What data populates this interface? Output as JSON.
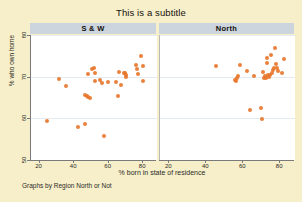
{
  "figure": {
    "subtitle": "This is a subtitle",
    "note": "Graphs by Region North or Not",
    "background_color": "#f7efc9",
    "panel_header_color": "#ccd4de",
    "marker_color": "#e8762c",
    "gridline_color": "#e3eaf2"
  },
  "chart_data": {
    "type": "scatter",
    "title": "This is a subtitle",
    "xlabel": "% born in state of residence",
    "ylabel": "% who own home",
    "note": "Graphs by Region North or Not",
    "xlim": [
      15,
      88
    ],
    "ylim": [
      50,
      80
    ],
    "xticks": [
      20,
      40,
      60,
      80
    ],
    "yticks": [
      50,
      60,
      70,
      80
    ],
    "grid": "horizontal",
    "legend": "none",
    "marker_color": "#e8762c",
    "panels": [
      {
        "label": "S & W",
        "points": [
          [
            24.3,
            59.3
          ],
          [
            31.2,
            69.5
          ],
          [
            35.1,
            67.8
          ],
          [
            42.3,
            57.9
          ],
          [
            46.2,
            58.6
          ],
          [
            46.0,
            65.6
          ],
          [
            47.3,
            65.4
          ],
          [
            48.1,
            65.1
          ],
          [
            49.4,
            65.0
          ],
          [
            47.9,
            70.7
          ],
          [
            50.6,
            71.9
          ],
          [
            51.3,
            72.2
          ],
          [
            52.2,
            70.8
          ],
          [
            52.0,
            68.9
          ],
          [
            55.0,
            69.2
          ],
          [
            56.4,
            68.4
          ],
          [
            57.3,
            55.8
          ],
          [
            59.6,
            68.8
          ],
          [
            64.3,
            68.7
          ],
          [
            65.4,
            65.3
          ],
          [
            65.8,
            71.2
          ],
          [
            66.9,
            67.9
          ],
          [
            68.9,
            71.0
          ],
          [
            69.6,
            70.9
          ],
          [
            69.9,
            70.3
          ],
          [
            70.2,
            69.9
          ],
          [
            75.8,
            72.8
          ],
          [
            76.3,
            71.9
          ],
          [
            77.0,
            70.6
          ],
          [
            78.9,
            74.9
          ],
          [
            79.6,
            72.6
          ],
          [
            79.9,
            68.9
          ]
        ]
      },
      {
        "label": "North",
        "points": [
          [
            45.1,
            72.6
          ],
          [
            55.5,
            69.3
          ],
          [
            56.2,
            68.9
          ],
          [
            56.4,
            69.8
          ],
          [
            57.0,
            70.2
          ],
          [
            58.2,
            72.9
          ],
          [
            62.3,
            71.4
          ],
          [
            63.9,
            61.9
          ],
          [
            65.8,
            70.2
          ],
          [
            69.4,
            62.5
          ],
          [
            70.2,
            59.9
          ],
          [
            70.5,
            71.2
          ],
          [
            71.3,
            69.8
          ],
          [
            71.9,
            70.1
          ],
          [
            72.4,
            69.6
          ],
          [
            72.9,
            73.3
          ],
          [
            73.1,
            74.5
          ],
          [
            73.6,
            70.4
          ],
          [
            74.1,
            70.0
          ],
          [
            74.6,
            70.5
          ],
          [
            75.0,
            75.3
          ],
          [
            75.4,
            71.0
          ],
          [
            76.1,
            71.6
          ],
          [
            76.6,
            72.2
          ],
          [
            77.2,
            76.8
          ],
          [
            77.8,
            73.0
          ],
          [
            78.4,
            72.1
          ],
          [
            79.0,
            71.3
          ],
          [
            81.0,
            70.8
          ],
          [
            82.0,
            74.2
          ]
        ]
      }
    ]
  },
  "axes": {
    "x_tick_labels": [
      "20",
      "40",
      "60",
      "80"
    ],
    "y_tick_labels": [
      "80",
      "70",
      "60",
      "50"
    ]
  }
}
